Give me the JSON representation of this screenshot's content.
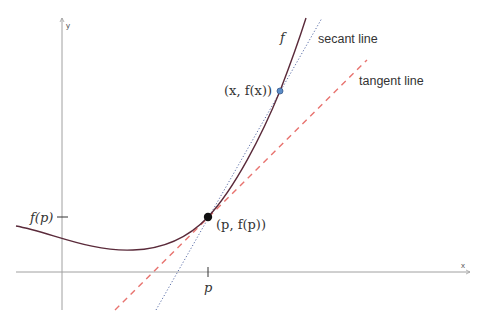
{
  "diagram": {
    "axes": {
      "x_label": "x",
      "y_label": "y"
    },
    "curve_label": "f",
    "secant_label": "secant line",
    "tangent_label": "tangent line",
    "secant_point_label": "(x, f(x))",
    "tangent_point_label": "(p, f(p))",
    "x_tick_label": "p",
    "y_tick_label": "f(p)",
    "colors": {
      "curve": "#5a2a3a",
      "tangent": "#e8736f",
      "secant": "#5a6ea8",
      "secant_point": "#5b8cc7",
      "tangent_point": "#111111",
      "axis": "#999999"
    }
  }
}
